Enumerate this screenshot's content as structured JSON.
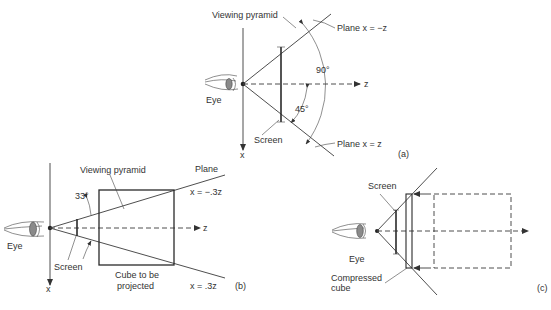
{
  "figure": {
    "panels": [
      {
        "id": "a",
        "tag": "(a)",
        "labels": {
          "viewing_pyramid": "Viewing pyramid",
          "plane_top": "Plane x = −z",
          "plane_bottom": "Plane x = z",
          "angle_full": "90°",
          "angle_half": "45°",
          "eye": "Eye",
          "screen": "Screen",
          "x_axis": "x",
          "z_axis": "z"
        }
      },
      {
        "id": "b",
        "tag": "(b)",
        "labels": {
          "viewing_pyramid": "Viewing pyramid",
          "plane": "Plane",
          "plane_top_eq": "x = −.3z",
          "plane_bottom_eq": "x = .3z",
          "angle": "33°",
          "eye": "Eye",
          "screen": "Screen",
          "cube_line1": "Cube to be",
          "cube_line2": "projected",
          "x_axis": "x",
          "z_axis": "z"
        }
      },
      {
        "id": "c",
        "tag": "(c)",
        "labels": {
          "screen": "Screen",
          "eye": "Eye",
          "compressed_line1": "Compressed",
          "compressed_line2": "cube"
        }
      }
    ],
    "colors": {
      "ink": "#333333",
      "background": "#ffffff"
    }
  }
}
